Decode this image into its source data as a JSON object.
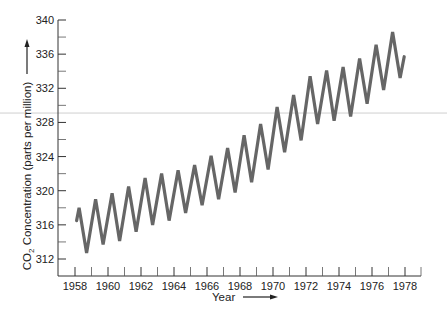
{
  "chart_data": {
    "type": "line",
    "title": "",
    "xlabel": "Year",
    "ylabel": "CO2 Concentration (parts per million)",
    "ylabel_parts": {
      "main": "CO",
      "subscript": "2",
      "rest": " Concentration (parts per million)"
    },
    "xlim": [
      1957.9,
      1978.9
    ],
    "ylim": [
      310,
      340
    ],
    "grid": false,
    "legend": null,
    "x_ticks": [
      1958,
      1960,
      1962,
      1964,
      1966,
      1968,
      1970,
      1972,
      1974,
      1976,
      1978
    ],
    "x_minor_ticks": [
      1959,
      1961,
      1963,
      1965,
      1967,
      1969,
      1971,
      1973,
      1975,
      1977
    ],
    "y_ticks": [
      312,
      316,
      320,
      324,
      328,
      332,
      336,
      340
    ],
    "y_minor_ticks": [
      314,
      318,
      322,
      326,
      330,
      334,
      338
    ],
    "line_color": "#666666",
    "series": [
      {
        "name": "CO2 concentration (Mauna Loa)",
        "points": [
          [
            1958.1,
            316.5
          ],
          [
            1958.25,
            318.0
          ],
          [
            1958.7,
            312.7
          ],
          [
            1959.25,
            319.0
          ],
          [
            1959.7,
            313.7
          ],
          [
            1960.25,
            319.7
          ],
          [
            1960.7,
            314.1
          ],
          [
            1961.25,
            320.5
          ],
          [
            1961.7,
            315.2
          ],
          [
            1962.25,
            321.5
          ],
          [
            1962.7,
            316.0
          ],
          [
            1963.25,
            322.0
          ],
          [
            1963.7,
            316.5
          ],
          [
            1964.25,
            322.4
          ],
          [
            1964.7,
            317.4
          ],
          [
            1965.25,
            323.0
          ],
          [
            1965.7,
            318.3
          ],
          [
            1966.25,
            324.1
          ],
          [
            1966.7,
            319.0
          ],
          [
            1967.25,
            325.0
          ],
          [
            1967.7,
            319.8
          ],
          [
            1968.25,
            326.5
          ],
          [
            1968.7,
            321.0
          ],
          [
            1969.25,
            327.8
          ],
          [
            1969.7,
            322.5
          ],
          [
            1970.25,
            329.8
          ],
          [
            1970.7,
            324.5
          ],
          [
            1971.25,
            331.2
          ],
          [
            1971.7,
            325.9
          ],
          [
            1972.25,
            333.4
          ],
          [
            1972.7,
            327.8
          ],
          [
            1973.25,
            334.1
          ],
          [
            1973.7,
            328.2
          ],
          [
            1974.25,
            334.5
          ],
          [
            1974.7,
            328.7
          ],
          [
            1975.25,
            335.5
          ],
          [
            1975.7,
            330.2
          ],
          [
            1976.25,
            337.1
          ],
          [
            1976.7,
            331.8
          ],
          [
            1977.25,
            338.6
          ],
          [
            1977.7,
            333.2
          ],
          [
            1977.95,
            335.7
          ]
        ]
      }
    ]
  },
  "decorations": {
    "horizontal_rule_y_value": 329.1,
    "horizontal_rule_color": "#cfcfcf"
  }
}
